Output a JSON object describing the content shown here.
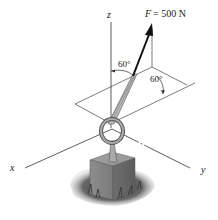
{
  "figure": {
    "force_label": "F = 500 N",
    "force_symbol": "F",
    "force_value": "= 500 N",
    "angle_from_z": "60°",
    "angle_from_plane_line": "60°",
    "axes": {
      "x": "x",
      "y": "y",
      "z": "z"
    },
    "colors": {
      "line": "#333333",
      "arrow": "#111111",
      "block": "#8a8a8a",
      "ground": "#555555"
    }
  }
}
